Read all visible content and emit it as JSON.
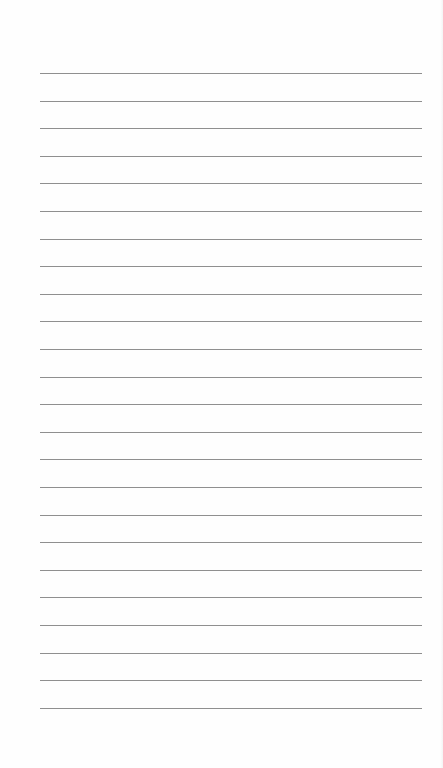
{
  "document": {
    "type": "lined-paper",
    "line_count": 24,
    "line_color": "#8f8f8f",
    "background_color": "#fefefe",
    "text": ""
  }
}
